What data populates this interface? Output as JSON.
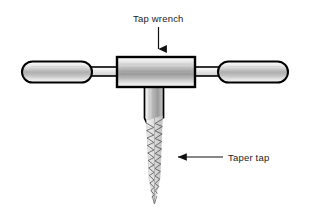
{
  "figure": {
    "background_color": "#ffffff",
    "line_color": "#000000",
    "text_color": "#1a1a1a",
    "metal_light": "#f2f2f2",
    "metal_mid": "#b8b8b8",
    "metal_dark": "#8a8a8a"
  },
  "labels": {
    "tap_wrench": "Tap wrench",
    "taper_tap": "Taper tap"
  },
  "parts": {
    "left_handle": "left-handle",
    "right_handle": "right-handle",
    "left_rod": "left-connecting-rod",
    "right_rod": "right-connecting-rod",
    "body": "wrench-body",
    "shank": "tap-shank",
    "threads": "tap-threaded-section",
    "tip": "tap-tip"
  },
  "annotations": {
    "tap_wrench_arrow": "down-arrow",
    "taper_tap_arrow": "left-arrow"
  }
}
